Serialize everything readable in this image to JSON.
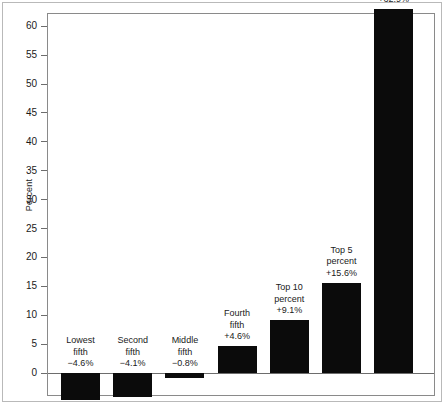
{
  "chart_data": {
    "type": "bar",
    "title": "",
    "subtitle": "",
    "xlabel": "",
    "ylabel": "Percent",
    "ylim": [
      -8,
      64
    ],
    "grid": false,
    "legend": "none",
    "categories": [
      "Lowest fifth",
      "Second fifth",
      "Middle fifth",
      "Fourth fifth",
      "Top 10 percent",
      "Top 5 percent",
      "Top 1 percent"
    ],
    "values": [
      -4.6,
      -4.1,
      -0.8,
      4.6,
      9.1,
      15.6,
      62.9
    ],
    "value_labels": [
      "−4.6%",
      "−4.1%",
      "−0.8%",
      "+4.6%",
      "+9.1%",
      "+15.6%",
      "+62.9%"
    ],
    "yticks": [
      0,
      5,
      10,
      15,
      20,
      25,
      30,
      35,
      40,
      45,
      50,
      55,
      60
    ],
    "ytick_labels": [
      "0",
      "5",
      "10",
      "15",
      "20",
      "25",
      "30",
      "35",
      "40",
      "45",
      "50",
      "55",
      "60"
    ],
    "bar_color": "#0b0b0b",
    "axis_color": "#6d6d6d",
    "frame_color": "#8a8a8a",
    "background": "#ffffff",
    "bars": [
      {
        "name": "Lowest fifth",
        "label_lines": [
          "Lowest",
          "fifth",
          "−4.6%"
        ],
        "value": -4.6
      },
      {
        "name": "Second fifth",
        "label_lines": [
          "Second",
          "fifth",
          "−4.1%"
        ],
        "value": -4.1
      },
      {
        "name": "Middle fifth",
        "label_lines": [
          "Middle",
          "fifth",
          "−0.8%"
        ],
        "value": -0.8
      },
      {
        "name": "Fourth fifth",
        "label_lines": [
          "Fourth",
          "fifth",
          "+4.6%"
        ],
        "value": 4.6
      },
      {
        "name": "Top 10 percent",
        "label_lines": [
          "Top 10",
          "percent",
          "+9.1%"
        ],
        "value": 9.1
      },
      {
        "name": "Top 5 percent",
        "label_lines": [
          "Top 5",
          "percent",
          "+15.6%"
        ],
        "value": 15.6
      },
      {
        "name": "Top 1 percent",
        "label_lines": [
          "Top 1",
          "percent",
          "+62.9%"
        ],
        "value": 62.9
      }
    ]
  },
  "axis": {
    "y_title": "Percent",
    "ticks": [
      {
        "label": "60"
      },
      {
        "label": "55"
      },
      {
        "label": "50"
      },
      {
        "label": "45"
      },
      {
        "label": "40"
      },
      {
        "label": "35"
      },
      {
        "label": "30"
      },
      {
        "label": "25"
      },
      {
        "label": "20"
      },
      {
        "label": "15"
      },
      {
        "label": "10"
      },
      {
        "label": "5"
      },
      {
        "label": "0"
      }
    ]
  },
  "bar_labels": {
    "b0": {
      "l0": "Lowest",
      "l1": "fifth",
      "l2": "−4.6%"
    },
    "b1": {
      "l0": "Second",
      "l1": "fifth",
      "l2": "−4.1%"
    },
    "b2": {
      "l0": "Middle",
      "l1": "fifth",
      "l2": "−0.8%"
    },
    "b3": {
      "l0": "Fourth",
      "l1": "fifth",
      "l2": "+4.6%"
    },
    "b4": {
      "l0": "Top 10",
      "l1": "percent",
      "l2": "+9.1%"
    },
    "b5": {
      "l0": "Top 5",
      "l1": "percent",
      "l2": "+15.6%"
    },
    "b6": {
      "l0": "Top 1",
      "l1": "percent",
      "l2": "+62.9%"
    }
  }
}
